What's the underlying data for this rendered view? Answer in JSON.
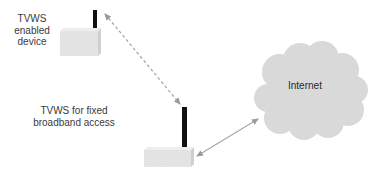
{
  "diagram": {
    "nodes": {
      "enabled_device": {
        "label_lines": [
          "TVWS",
          "enabled",
          "device"
        ]
      },
      "fixed_broadband": {
        "label_lines": [
          "TVWS for fixed",
          "broadband access"
        ]
      },
      "internet": {
        "label": "Internet"
      }
    },
    "edges": [
      {
        "from": "enabled_device",
        "to": "fixed_broadband",
        "style": "dashed",
        "direction": "bidirectional"
      },
      {
        "from": "fixed_broadband",
        "to": "internet",
        "style": "solid",
        "direction": "bidirectional"
      }
    ],
    "colors": {
      "device_box": "#e6e6e6",
      "antenna": "#111111",
      "cloud": "#dcdcdc",
      "arrow": "#a8a8a8"
    }
  }
}
